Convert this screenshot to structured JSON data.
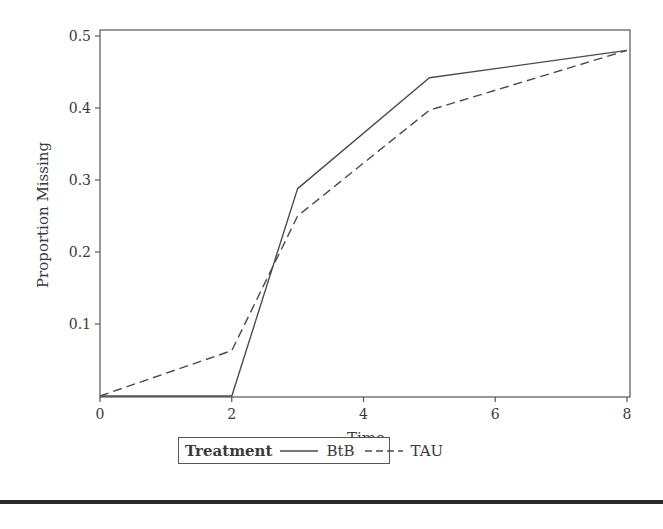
{
  "chart_data": {
    "type": "line",
    "title": "",
    "xlabel": "Time",
    "ylabel": "Proportion Missing",
    "xlim": [
      0,
      8
    ],
    "ylim": [
      0,
      0.5
    ],
    "x_ticks": [
      "0",
      "2",
      "4",
      "6",
      "8"
    ],
    "y_ticks": [
      "0.1",
      "0.2",
      "0.3",
      "0.4",
      "0.5"
    ],
    "grid": false,
    "legend_position": "bottom",
    "legend_title": "Treatment",
    "series": [
      {
        "name": "BtB",
        "style": "solid",
        "x": [
          0,
          2,
          3,
          5,
          8
        ],
        "values": [
          0.0,
          0.0,
          0.288,
          0.442,
          0.48
        ]
      },
      {
        "name": "TAU",
        "style": "dashed",
        "x": [
          0,
          2,
          3,
          5,
          8
        ],
        "values": [
          0.0,
          0.063,
          0.25,
          0.397,
          0.48
        ]
      }
    ]
  },
  "legend": {
    "title": "Treatment",
    "items": [
      {
        "label": "BtB",
        "style": "solid"
      },
      {
        "label": "TAU",
        "style": "dashed"
      }
    ]
  },
  "colors": {
    "line": "#4a4a4a",
    "axis": "#555555"
  }
}
